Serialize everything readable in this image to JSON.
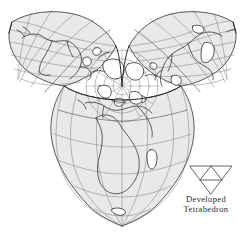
{
  "figure": {
    "name": "developed-tetrahedron-world-map",
    "title": "Developed Tetrahedron",
    "projection_type": "tetrahedral gnomonic world projection",
    "background_color": "#ffffff",
    "lobe_fill_color": "#e9e9e9",
    "graticule_color": "#6e6e6e",
    "coastline_color": "#1e1e1e",
    "edge_color": "#2a2a2a"
  },
  "legend": {
    "icon_name": "developed-tetrahedron-net-icon",
    "icon_description": "downward pointing triangle subdivided into four smaller triangles",
    "caption_line1": "Developed",
    "caption_line2": "Tetrahedron"
  },
  "map": {
    "center_feature": "North Pole",
    "lobes": [
      {
        "id": "upper-left",
        "label": "North America lobe"
      },
      {
        "id": "upper-right",
        "label": "Asia Pacific lobe"
      },
      {
        "id": "lower",
        "label": "Africa Europe lobe"
      }
    ],
    "graticule": {
      "meridian_interval_degrees": 30,
      "parallel_interval_degrees": 15,
      "pole_marked": true
    }
  }
}
